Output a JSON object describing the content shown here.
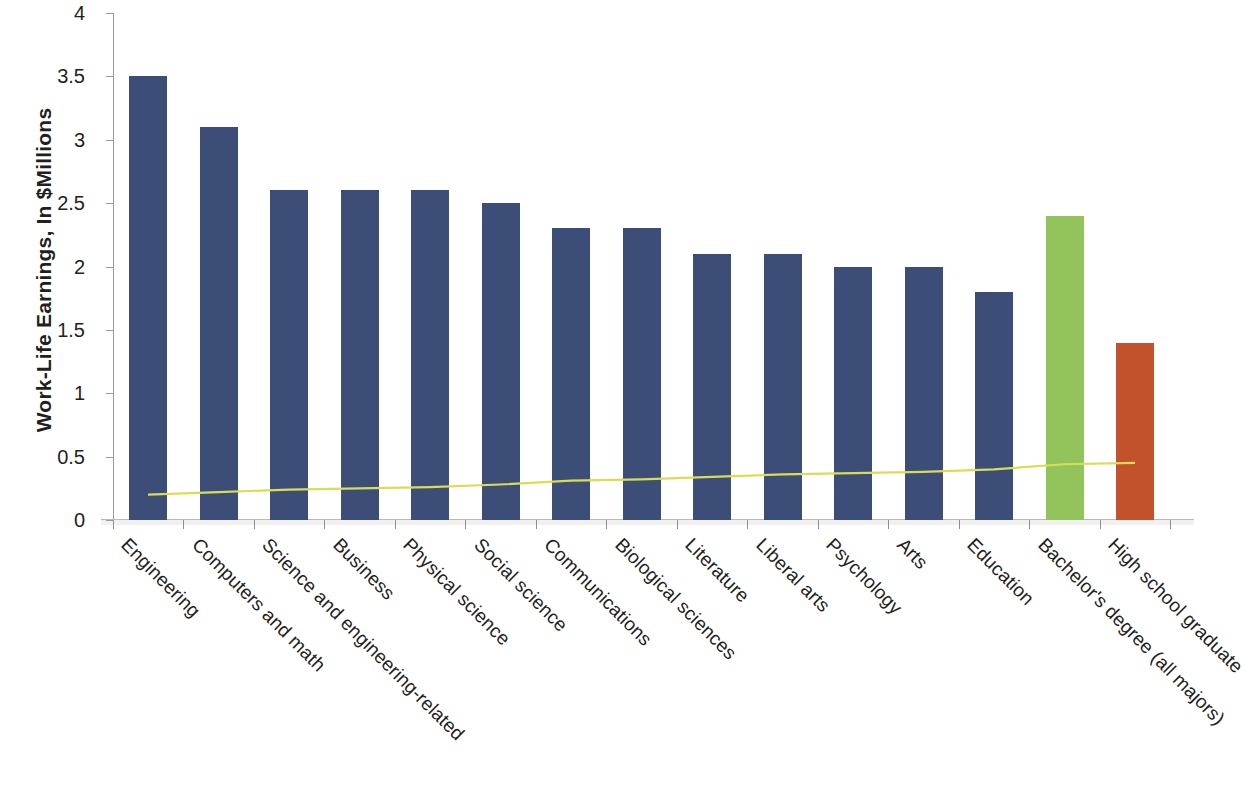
{
  "chart_data": {
    "type": "bar",
    "title": "",
    "subtitle": "",
    "xlabel": "",
    "ylabel": "Work-Life Earnings, In $Millions",
    "ylim": [
      0,
      4
    ],
    "ytick_labels": [
      "0",
      "0.5",
      "1",
      "1.5",
      "2",
      "2.5",
      "3",
      "3.5",
      "4"
    ],
    "ytick_values": [
      0,
      0.5,
      1,
      1.5,
      2,
      2.5,
      3,
      3.5,
      4
    ],
    "grid": false,
    "legend": "none",
    "categories": [
      "Engineering",
      "Computers and math",
      "Science and engineering-related",
      "Business",
      "Physical science",
      "Social science",
      "Communications",
      "Biological sciences",
      "Literature",
      "Liberal arts",
      "Psychology",
      "Arts",
      "Education",
      "Bachelor's degree (all majors)",
      "High school graduate"
    ],
    "values": [
      3.5,
      3.1,
      2.6,
      2.6,
      2.6,
      2.5,
      2.3,
      2.3,
      2.1,
      2.1,
      2.0,
      2.0,
      1.8,
      2.4,
      1.4
    ],
    "bar_colors": [
      "#3c4d78",
      "#3c4d78",
      "#3c4d78",
      "#3c4d78",
      "#3c4d78",
      "#3c4d78",
      "#3c4d78",
      "#3c4d78",
      "#3c4d78",
      "#3c4d78",
      "#3c4d78",
      "#3c4d78",
      "#3c4d78",
      "#93c45b",
      "#c2522c"
    ],
    "series": [
      {
        "name": "Work-Life Earnings",
        "type": "bar",
        "values": [
          3.5,
          3.1,
          2.6,
          2.6,
          2.6,
          2.5,
          2.3,
          2.3,
          2.1,
          2.1,
          2.0,
          2.0,
          1.8,
          2.4,
          1.4
        ]
      },
      {
        "name": "trend-line",
        "type": "line",
        "color": "#d9dd52",
        "values": [
          0.2,
          0.22,
          0.24,
          0.25,
          0.26,
          0.28,
          0.31,
          0.32,
          0.34,
          0.36,
          0.37,
          0.38,
          0.4,
          0.44,
          0.45
        ]
      }
    ],
    "colors": {
      "bar_primary": "#3c4d78",
      "bar_highlight_green": "#93c45b",
      "bar_highlight_orange": "#c2522c",
      "trend_line": "#d9dd52",
      "axis": "#9a9a9a",
      "text": "#231f20"
    }
  }
}
